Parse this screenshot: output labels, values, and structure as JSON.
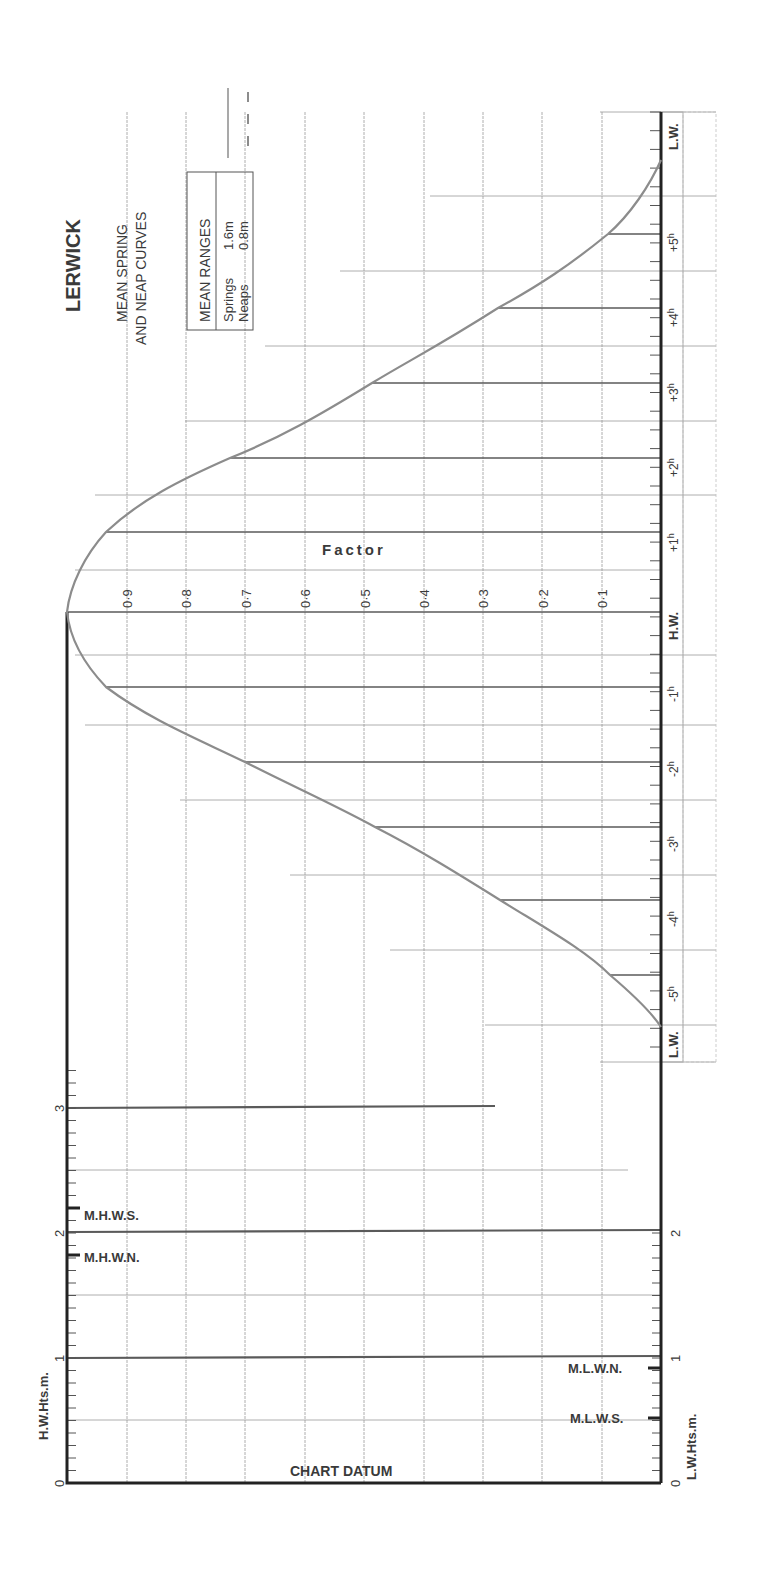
{
  "title": "LERWICK",
  "subtitle_line1": "MEAN SPRING",
  "subtitle_line2": "AND NEAP CURVES",
  "legend": {
    "header": "MEAN RANGES",
    "springs_label": "Springs",
    "springs_value": "1.6m",
    "neaps_label": "Neaps",
    "neaps_value": "0.8m"
  },
  "factor_label": "Factor",
  "factor_ticks": [
    "0·9",
    "0·8",
    "0·7",
    "0·6",
    "0·5",
    "0·4",
    "0·3",
    "0·2",
    "0·1"
  ],
  "time_axis": {
    "lw_start": "L.W.",
    "hw": "H.W.",
    "lw_end": "L.W.",
    "before": [
      "-5",
      "-4",
      "-3",
      "-2",
      "-1"
    ],
    "after": [
      "+1",
      "+2",
      "+3",
      "+4",
      "+5"
    ],
    "hour_suffix": "h"
  },
  "height_axes": {
    "left_label": "H.W.Hts.m.",
    "right_label": "L.W.Hts.m.",
    "left_ticks": [
      "0",
      "1",
      "2",
      "3"
    ],
    "right_ticks": [
      "0",
      "1",
      "2"
    ],
    "chart_datum": "CHART DATUM",
    "mhws": "M.H.W.S.",
    "mhwn": "M.H.W.N.",
    "mlwn": "M.L.W.N.",
    "mlws": "M.L.W.S."
  },
  "colors": {
    "axis": "#222222",
    "grid": "#9a9a9a",
    "curve": "#8c8c8c",
    "text": "#3a3a3a"
  },
  "chart_data": {
    "type": "line",
    "xlabel": "Hours relative to H.W.",
    "ylabel": "Factor",
    "x": [
      -6,
      -5,
      -4,
      -3,
      -2,
      -1,
      0,
      1,
      2,
      3,
      4,
      5,
      6
    ],
    "series": [
      {
        "name": "Springs (1.6m)",
        "values": [
          0.0,
          0.08,
          0.27,
          0.48,
          0.7,
          0.93,
          1.0,
          0.93,
          0.72,
          0.48,
          0.27,
          0.08,
          0.0
        ]
      }
    ],
    "mean_ranges": {
      "springs_m": 1.6,
      "neaps_m": 0.8
    },
    "heights_m": {
      "MHWS": 2.1,
      "MHWN": 1.8,
      "MLWN": 0.9,
      "MLWS": 0.5
    },
    "ylim": [
      0,
      1
    ],
    "grid": true
  }
}
